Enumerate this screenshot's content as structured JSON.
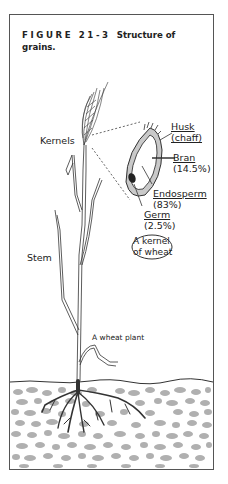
{
  "figure": {
    "number": "FIGURE 21-3",
    "title": "Structure of grains."
  },
  "labels": {
    "kernels": "Kernels",
    "stem": "Stem",
    "plant": "A wheat plant",
    "kernel_callout_line1": "A kernel",
    "kernel_callout_line2": "of wheat"
  },
  "kernel_parts": [
    {
      "name": "Husk",
      "detail": "(chaff)"
    },
    {
      "name": "Bran",
      "detail": "(14.5%)"
    },
    {
      "name": "Endosperm",
      "detail": "(83%)"
    },
    {
      "name": "Germ",
      "detail": "(2.5%)"
    }
  ],
  "colors": {
    "frame": "#555555",
    "soil_pebble": "#a8a8a8",
    "roots": "#333333",
    "text": "#222222"
  }
}
